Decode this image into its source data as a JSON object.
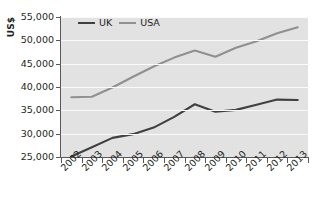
{
  "chart_data": {
    "type": "line",
    "title": "",
    "xlabel": "",
    "ylabel": "US$",
    "categories": [
      "2002",
      "2003",
      "2004",
      "2005",
      "2006",
      "2007",
      "2008",
      "2009",
      "2010",
      "2011",
      "2012",
      "2013"
    ],
    "ylim": [
      25000,
      55000
    ],
    "yticks": [
      25000,
      30000,
      35000,
      40000,
      45000,
      50000,
      55000
    ],
    "ytick_labels": [
      "25,000",
      "30,000",
      "35,000",
      "40,000",
      "45,000",
      "50,000",
      "55,000"
    ],
    "grid": true,
    "legend_position": "top-center",
    "series": [
      {
        "name": "UK",
        "color": "#404040",
        "values": [
          25100,
          27100,
          29100,
          29900,
          31300,
          33600,
          36300,
          34700,
          35100,
          36200,
          37300,
          37200
        ]
      },
      {
        "name": "USA",
        "color": "#909090",
        "values": [
          37800,
          37900,
          39900,
          42200,
          44400,
          46300,
          47800,
          46500,
          48400,
          49800,
          51500,
          52800
        ]
      }
    ]
  },
  "style": {
    "plot_background": "#e2e2e2",
    "gridline_color": "#fafafa",
    "axis_color": "#58595b",
    "text_color": "#231f20",
    "page_background": "#ffffff"
  }
}
